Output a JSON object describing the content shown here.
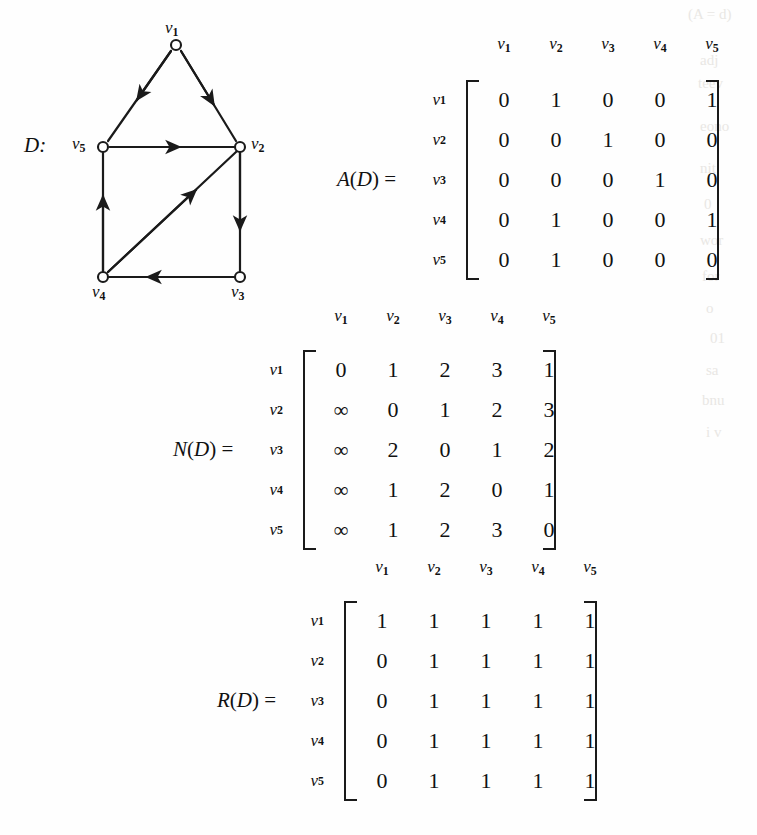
{
  "figure": {
    "graph_label": "D:",
    "vertices": [
      {
        "id": "v1",
        "label_base": "v",
        "label_sub": "1",
        "cx": 176,
        "cy": 45,
        "label_x": 165,
        "label_y": 20
      },
      {
        "id": "v2",
        "label_base": "v",
        "label_sub": "2",
        "cx": 240,
        "cy": 147,
        "label_x": 251,
        "label_y": 134
      },
      {
        "id": "v3",
        "label_base": "v",
        "label_sub": "3",
        "cx": 240,
        "cy": 277,
        "label_x": 231,
        "label_y": 282
      },
      {
        "id": "v4",
        "label_base": "v",
        "label_sub": "4",
        "cx": 103,
        "cy": 277,
        "label_x": 92,
        "label_y": 282
      },
      {
        "id": "v5",
        "label_base": "v",
        "label_sub": "5",
        "cx": 103,
        "cy": 147,
        "label_x": 73,
        "label_y": 134
      }
    ],
    "edges": [
      {
        "from": "v1",
        "to": "v5"
      },
      {
        "from": "v1",
        "to": "v2"
      },
      {
        "from": "v5",
        "to": "v2"
      },
      {
        "from": "v2",
        "to": "v3"
      },
      {
        "from": "v3",
        "to": "v4"
      },
      {
        "from": "v4",
        "to": "v5"
      },
      {
        "from": "v4",
        "to": "v2"
      }
    ]
  },
  "matrices": [
    {
      "id": "A",
      "name_main": "A",
      "name_paren": "(",
      "name_arg": "D",
      "name_paren_close": ")",
      "name_eq": " = ",
      "col_headers": [
        "1",
        "2",
        "3",
        "4",
        "5"
      ],
      "row_headers": [
        "1",
        "2",
        "3",
        "4",
        "5"
      ],
      "rows": [
        [
          "0",
          "1",
          "0",
          "0",
          "1"
        ],
        [
          "0",
          "0",
          "1",
          "0",
          "0"
        ],
        [
          "0",
          "0",
          "0",
          "1",
          "0"
        ],
        [
          "0",
          "1",
          "0",
          "0",
          "1"
        ],
        [
          "0",
          "1",
          "0",
          "0",
          "0"
        ]
      ]
    },
    {
      "id": "N",
      "name_main": "N",
      "name_paren": "(",
      "name_arg": "D",
      "name_paren_close": ")",
      "name_eq": " = ",
      "col_headers": [
        "1",
        "2",
        "3",
        "4",
        "5"
      ],
      "row_headers": [
        "1",
        "2",
        "3",
        "4",
        "5"
      ],
      "rows": [
        [
          "0",
          "1",
          "2",
          "3",
          "1"
        ],
        [
          "∞",
          "0",
          "1",
          "2",
          "3"
        ],
        [
          "∞",
          "2",
          "0",
          "1",
          "2"
        ],
        [
          "∞",
          "1",
          "2",
          "0",
          "1"
        ],
        [
          "∞",
          "1",
          "2",
          "3",
          "0"
        ]
      ]
    },
    {
      "id": "R",
      "name_main": "R",
      "name_paren": "(",
      "name_arg": "D",
      "name_paren_close": ")",
      "name_eq": " = ",
      "col_headers": [
        "1",
        "2",
        "3",
        "4",
        "5"
      ],
      "row_headers": [
        "1",
        "2",
        "3",
        "4",
        "5"
      ],
      "rows": [
        [
          "1",
          "1",
          "1",
          "1",
          "1"
        ],
        [
          "0",
          "1",
          "1",
          "1",
          "1"
        ],
        [
          "0",
          "1",
          "1",
          "1",
          "1"
        ],
        [
          "0",
          "1",
          "1",
          "1",
          "1"
        ],
        [
          "0",
          "1",
          "1",
          "1",
          "1"
        ]
      ]
    }
  ],
  "style": {
    "ink": "#1a1a1a",
    "paper": "#fefefe"
  }
}
